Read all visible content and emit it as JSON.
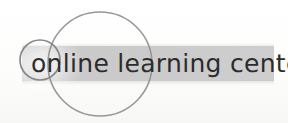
{
  "image": {
    "kind": "logo-artwork",
    "width": 288,
    "height": 123,
    "background_color": "#fefefe"
  },
  "logo": {
    "wordmark": "online learning center",
    "wordmark_color": "#262626",
    "band": {
      "name": "highlight-band",
      "color": "#cacaca",
      "x": 22,
      "y": 46,
      "width": 252,
      "height": 35
    },
    "rings": [
      {
        "name": "small-ring",
        "stroke_color": "#8a8a8a",
        "cx": 40,
        "cy": 60,
        "r": 20,
        "stroke_width": 1.6
      },
      {
        "name": "large-ring",
        "stroke_color": "#8f8f8f",
        "cx": 100,
        "cy": 64,
        "r": 52,
        "stroke_width": 1.6
      }
    ],
    "glow": {
      "name": "radial-glow",
      "color": "#ffffff"
    }
  }
}
